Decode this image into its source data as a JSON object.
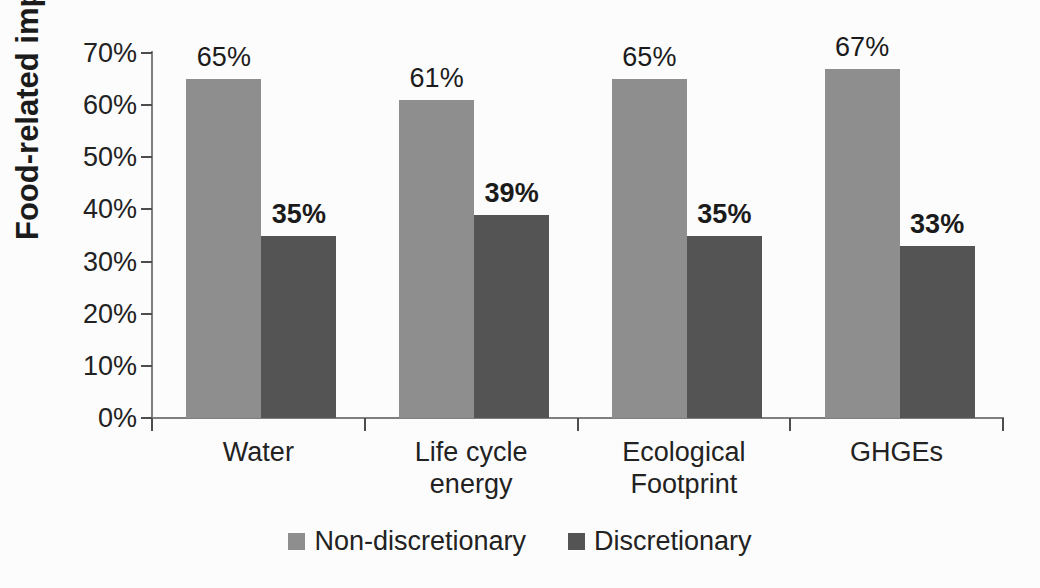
{
  "chart_data": {
    "type": "bar",
    "title": "",
    "xlabel": "",
    "ylabel": "Food-related impacts (%)",
    "ylim": [
      0,
      70
    ],
    "ytick_step": 10,
    "yticks": [
      "0%",
      "10%",
      "20%",
      "30%",
      "40%",
      "50%",
      "60%",
      "70%"
    ],
    "grid": false,
    "legend_position": "bottom-center",
    "categories": [
      "Water",
      "Life cycle\nenergy",
      "Ecological\nFootprint",
      "GHGEs"
    ],
    "series": [
      {
        "name": "Non-discretionary",
        "color": "#8e8e8e",
        "values": [
          65,
          61,
          65,
          67
        ],
        "labels": [
          "65%",
          "61%",
          "65%",
          "67%"
        ],
        "label_bold": false
      },
      {
        "name": "Discretionary",
        "color": "#545454",
        "values": [
          35,
          39,
          35,
          33
        ],
        "labels": [
          "35%",
          "39%",
          "35%",
          "33%"
        ],
        "label_bold": true
      }
    ]
  },
  "legend": {
    "items": [
      {
        "label": "Non-discretionary",
        "color": "#8e8e8e"
      },
      {
        "label": "Discretionary",
        "color": "#545454"
      }
    ]
  },
  "colors": {
    "axis_line": "#7f7f7f",
    "tick_mark": "#4d4d4d",
    "text": "#1e1e1e",
    "background": "#fcfcfc"
  }
}
